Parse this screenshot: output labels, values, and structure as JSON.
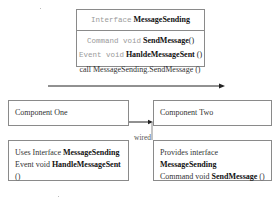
{
  "interface_box": {
    "keyword": "Interface",
    "name": "MessageSending",
    "methods": [
      {
        "prefix": "Command void",
        "name": "SendMessage",
        "suffix": "()"
      },
      {
        "prefix": "Event void",
        "name": "HanldeMessageSent",
        "suffix": "()"
      }
    ]
  },
  "call_label": "call MessageSending.SendMessage ()",
  "components": {
    "one": {
      "label": "Component One"
    },
    "two": {
      "label": "Component Two"
    }
  },
  "wire_label": "wired",
  "uses_box": {
    "line1_prefix": "Uses Interface",
    "line1_name": "MessageSending",
    "line2_prefix": "Event void",
    "line2_name": "HandleMessageSent",
    "line2_suffix": "()"
  },
  "provides_box": {
    "line1_prefix": "Provides interface",
    "line1_name": "MessageSending",
    "line2_prefix": "Command void",
    "line2_name": "SendMessage",
    "line2_suffix": "()"
  },
  "colors": {
    "border": "#8a8a8a",
    "line": "#222222",
    "keyword_gray": "#9a9a9a"
  }
}
